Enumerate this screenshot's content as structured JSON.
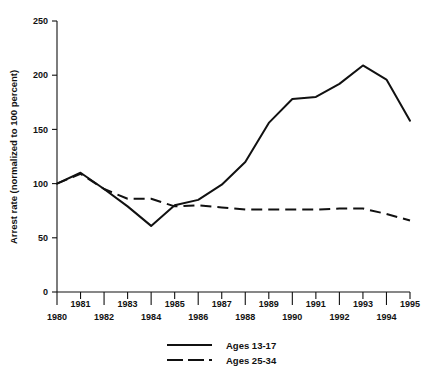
{
  "chart_data": {
    "type": "line",
    "title": "",
    "xlabel": "",
    "ylabel": "Arrest rate (normalized to 100 percent)",
    "x": [
      1980,
      1981,
      1982,
      1983,
      1984,
      1985,
      1986,
      1987,
      1988,
      1989,
      1990,
      1991,
      1992,
      1993,
      1994,
      1995
    ],
    "xlim": [
      1980,
      1995
    ],
    "ylim": [
      0,
      250
    ],
    "yticks": [
      0,
      50,
      100,
      150,
      200,
      250
    ],
    "ytick_labels": [
      "0",
      "50",
      "100",
      "150",
      "200",
      "250"
    ],
    "xtick_labels": [
      "1980",
      "1981",
      "1982",
      "1983",
      "1984",
      "1985",
      "1986",
      "1987",
      "1988",
      "1989",
      "1990",
      "1991",
      "1992",
      "1993",
      "1994",
      "1995"
    ],
    "xtick_rows": [
      1,
      0,
      1,
      0,
      1,
      0,
      1,
      0,
      1,
      0,
      1,
      0,
      1,
      0,
      1,
      0
    ],
    "grid": false,
    "legend_position": "bottom-center",
    "series": [
      {
        "name": "Ages 13-17",
        "style": "solid",
        "color": "#111111",
        "values": [
          100,
          110,
          95,
          79,
          61,
          80,
          85,
          99,
          120,
          156,
          178,
          180,
          192,
          209,
          196,
          158
        ]
      },
      {
        "name": "Ages 25-34",
        "style": "dashed",
        "color": "#111111",
        "values": [
          100,
          109,
          95,
          86,
          86,
          79,
          80,
          78,
          76,
          76,
          76,
          76,
          77,
          77,
          72,
          66
        ]
      }
    ]
  },
  "legend": {
    "entries": [
      {
        "label": "Ages 13-17"
      },
      {
        "label": "Ages 25-34"
      }
    ]
  },
  "colors": {
    "ink": "#111111",
    "background": "#ffffff"
  }
}
